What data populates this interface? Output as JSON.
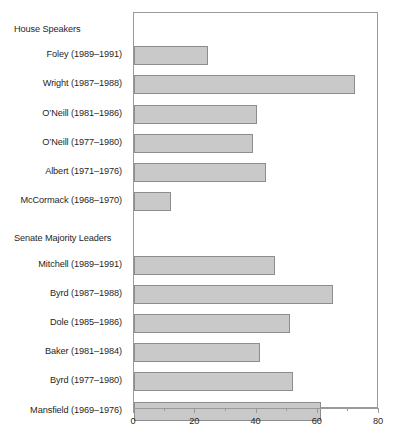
{
  "chart_data": {
    "type": "bar",
    "orientation": "horizontal",
    "title": "",
    "subtitle": "",
    "xlabel": "",
    "ylabel": "",
    "xlim": [
      0,
      80
    ],
    "ylim": null,
    "grid": false,
    "legend": null,
    "bar_color": "#c9c9c9",
    "bar_edge_color": "#8d8d8d",
    "axis_color": "#9a9a9a",
    "xticks": [
      0,
      10,
      20,
      30,
      40,
      50,
      60,
      70,
      80
    ],
    "xtick_labels": [
      "0",
      "",
      "20",
      "",
      "40",
      "",
      "60",
      "",
      "80"
    ],
    "groups": [
      {
        "name": "House Speakers",
        "categories": [
          "Foley (1989–1991)",
          "Wright (1987–1988)",
          "O’Neill (1981–1986)",
          "O’Neill (1977–1980)",
          "Albert (1971–1976)",
          "McCormack (1968–1970)"
        ],
        "values": [
          24,
          72,
          40,
          39,
          43,
          12
        ]
      },
      {
        "name": "Senate Majority Leaders",
        "categories": [
          "Mitchell (1989–1991)",
          "Byrd (1987–1988)",
          "Dole (1985–1986)",
          "Baker (1981–1984)",
          "Byrd (1977–1980)",
          "Mansfield (1969–1976)"
        ],
        "values": [
          46,
          65,
          51,
          41,
          52,
          61
        ]
      }
    ],
    "categories": [
      "Foley (1989–1991)",
      "Wright (1987–1988)",
      "O’Neill (1981–1986)",
      "O’Neill (1977–1980)",
      "Albert (1971–1976)",
      "McCormack (1968–1970)",
      "Mitchell (1989–1991)",
      "Byrd (1987–1988)",
      "Dole (1985–1986)",
      "Baker (1981–1984)",
      "Byrd (1977–1980)",
      "Mansfield (1969–1976)"
    ],
    "values": [
      24,
      72,
      40,
      39,
      43,
      12,
      46,
      65,
      51,
      41,
      52,
      61
    ]
  }
}
